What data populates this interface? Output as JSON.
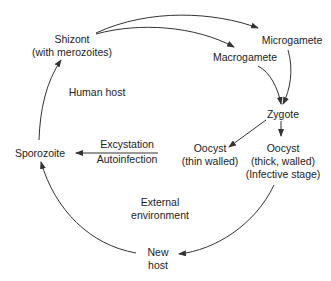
{
  "diagram": {
    "nodes": {
      "shizont": [
        "Shizont",
        "(with merozoites)"
      ],
      "microgamete": "Microgamete",
      "macrogamete": "Macrogamete",
      "zygote": "Zygote",
      "oocyst_thin": [
        "Oocyst",
        "(thin walled)"
      ],
      "oocyst_thick": [
        "Oocyst",
        "(thick, walled)",
        "(Infective stage)"
      ],
      "sporozoite": "Sporozoite",
      "new_host": [
        "New",
        "host"
      ]
    },
    "regions": {
      "human_host": "Human host",
      "external_env": [
        "External",
        "environment"
      ]
    },
    "edge_labels": {
      "excystation": "Excystation",
      "autoinfection": "Autoinfection"
    },
    "colors": {
      "line": "#333333",
      "text": "#222222",
      "background": "#ffffff"
    }
  }
}
